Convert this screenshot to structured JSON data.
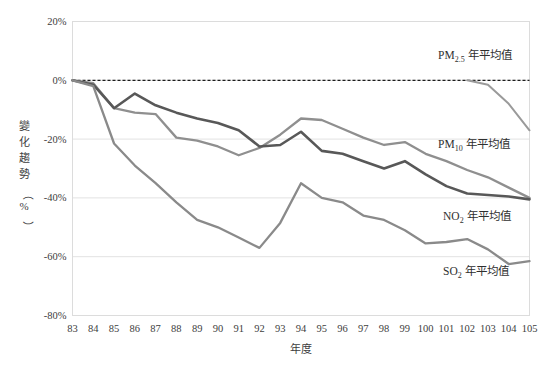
{
  "chart_data": {
    "type": "line",
    "title": "",
    "xlabel": "年度",
    "ylabel": "變化趨勢（%）",
    "ylabel_chars": [
      "變",
      "化",
      "趨",
      "勢",
      "（",
      "%",
      "）"
    ],
    "grid": true,
    "legend_position": "inline-right",
    "xlim": [
      83,
      105
    ],
    "ylim": [
      -80,
      20
    ],
    "ytick_labels": [
      "20%",
      "0%",
      "-20%",
      "-40%",
      "-60%",
      "-80%"
    ],
    "ytick_values": [
      20,
      0,
      -20,
      -40,
      -60,
      -80
    ],
    "categories": [
      83,
      84,
      85,
      86,
      87,
      88,
      89,
      90,
      91,
      92,
      93,
      94,
      95,
      96,
      97,
      98,
      99,
      100,
      101,
      102,
      103,
      104,
      105
    ],
    "xtick_labels": [
      "83",
      "84",
      "85",
      "86",
      "87",
      "88",
      "89",
      "90",
      "91",
      "92",
      "93",
      "94",
      "95",
      "96",
      "97",
      "98",
      "99",
      "100",
      "101",
      "102",
      "103",
      "104",
      "105"
    ],
    "zero_reference_line": 0,
    "series": [
      {
        "name": "PM2.5 年平均值",
        "label_html": "PM2.5 年平均值",
        "label_main": "PM",
        "label_sub": "2.5",
        "label_tail": " 年平均值",
        "color": "#9a9a9a",
        "stroke_width": 2.0,
        "start_category": 102,
        "x": [
          102,
          103,
          104,
          105
        ],
        "values": [
          0,
          -1.5,
          -8,
          -17
        ]
      },
      {
        "name": "PM10 年平均值",
        "label_html": "PM10 年平均值",
        "label_main": "PM",
        "label_sub": "10",
        "label_tail": " 年平均值",
        "color": "#8f8f8f",
        "stroke_width": 2.3,
        "start_category": 83,
        "x": [
          83,
          84,
          85,
          86,
          87,
          88,
          89,
          90,
          91,
          92,
          93,
          94,
          95,
          96,
          97,
          98,
          99,
          100,
          101,
          102,
          103,
          104,
          105
        ],
        "values": [
          0,
          -1,
          -9.5,
          -11,
          -11.5,
          -19.5,
          -20.5,
          -22.5,
          -25.5,
          -23,
          -18.5,
          -13,
          -13.5,
          -16.5,
          -19.5,
          -22,
          -21,
          -25,
          -27.5,
          -30.5,
          -33,
          -36.5,
          -40
        ]
      },
      {
        "name": "NO2 年平均值",
        "label_html": "NO2 年平均值",
        "label_main": "NO",
        "label_sub": "2",
        "label_tail": " 年平均值",
        "color": "#585858",
        "stroke_width": 2.6,
        "start_category": 83,
        "x": [
          83,
          84,
          85,
          86,
          87,
          88,
          89,
          90,
          91,
          92,
          93,
          94,
          95,
          96,
          97,
          98,
          99,
          100,
          101,
          102,
          103,
          104,
          105
        ],
        "values": [
          0,
          -1.5,
          -9.5,
          -4.5,
          -8.5,
          -11,
          -13,
          -14.5,
          -17,
          -22.5,
          -22,
          -17.5,
          -24,
          -25,
          -27.5,
          -30,
          -27.5,
          -32,
          -36,
          -38.5,
          -39,
          -39.5,
          -40.5
        ]
      },
      {
        "name": "SO2 年平均值",
        "label_html": "SO2 年平均值",
        "label_main": "SO",
        "label_sub": "2",
        "label_tail": " 年平均值",
        "color": "#8a8a8a",
        "stroke_width": 2.3,
        "start_category": 83,
        "x": [
          83,
          84,
          85,
          86,
          87,
          88,
          89,
          90,
          91,
          92,
          93,
          94,
          95,
          96,
          97,
          98,
          99,
          100,
          101,
          102,
          103,
          104,
          105
        ],
        "values": [
          0,
          -2,
          -21.5,
          -29,
          -35,
          -41.5,
          -47.5,
          -50,
          -53.5,
          -57,
          -48.5,
          -35,
          -40,
          -41.5,
          -46,
          -47.5,
          -51,
          -55.5,
          -55,
          -54,
          -57.5,
          -62.5,
          -61.5
        ]
      }
    ],
    "series_labels": [
      {
        "name": "PM2.5 年平均值",
        "main": "PM",
        "sub": "2.5",
        "tail": " 年平均值",
        "x": 438,
        "y": 59
      },
      {
        "name": "PM10 年平均值",
        "main": "PM",
        "sub": "10",
        "tail": " 年平均值",
        "x": 438,
        "y": 148
      },
      {
        "name": "NO2 年平均值",
        "main": "NO",
        "sub": "2",
        "tail": " 年平均值",
        "x": 443,
        "y": 220
      },
      {
        "name": "SO2 年平均值",
        "main": "SO",
        "sub": "2",
        "tail": " 年平均值",
        "x": 443,
        "y": 275
      }
    ]
  }
}
